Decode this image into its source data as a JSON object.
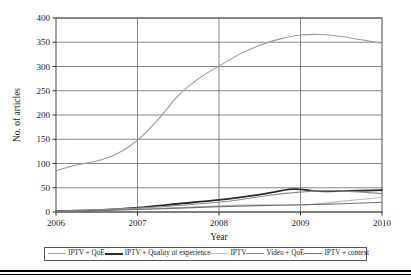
{
  "chart_data": {
    "type": "line",
    "title": "",
    "xlabel": "Year",
    "ylabel": "No. of articles",
    "xlim": [
      2006,
      2010
    ],
    "ylim": [
      0,
      400
    ],
    "ytick_step": 50,
    "grid": "horizontal-and-vertical",
    "legend_position": "bottom",
    "xticks": [
      "2006",
      "2007",
      "2008",
      "2009",
      "2010"
    ],
    "yticks": [
      "0",
      "50",
      "100",
      "150",
      "200",
      "250",
      "300",
      "350",
      "400"
    ],
    "x": [
      2006,
      2010
    ],
    "series": [
      {
        "name": "IPTV + QoE",
        "color": "#9a9a9a",
        "width": 1.1,
        "points": [
          [
            2006.0,
            85
          ],
          [
            2006.25,
            97
          ],
          [
            2006.5,
            105
          ],
          [
            2006.75,
            120
          ],
          [
            2007.0,
            148
          ],
          [
            2007.25,
            190
          ],
          [
            2007.5,
            240
          ],
          [
            2007.75,
            275
          ],
          [
            2008.0,
            301
          ],
          [
            2008.25,
            325
          ],
          [
            2008.5,
            344
          ],
          [
            2008.75,
            357
          ],
          [
            2009.0,
            365
          ],
          [
            2009.25,
            366
          ],
          [
            2009.5,
            362
          ],
          [
            2009.75,
            355
          ],
          [
            2010.0,
            348
          ]
        ]
      },
      {
        "name": "IPTV + Quality of experience",
        "color": "#2b2b2b",
        "width": 1.8,
        "points": [
          [
            2006.0,
            2
          ],
          [
            2006.5,
            4
          ],
          [
            2007.0,
            9
          ],
          [
            2007.5,
            17
          ],
          [
            2008.0,
            25
          ],
          [
            2008.5,
            36
          ],
          [
            2008.9,
            47
          ],
          [
            2009.2,
            43
          ],
          [
            2009.5,
            43
          ],
          [
            2010.0,
            45
          ]
        ]
      },
      {
        "name": "IPTV",
        "color": "#bdbdbd",
        "width": 1.1,
        "points": [
          [
            2006.0,
            1
          ],
          [
            2007.0,
            6
          ],
          [
            2008.0,
            13
          ],
          [
            2008.5,
            15
          ],
          [
            2009.0,
            14
          ],
          [
            2009.5,
            22
          ],
          [
            2010.0,
            30
          ]
        ]
      },
      {
        "name": "Video + QoE",
        "color": "#8c8c8c",
        "width": 1.1,
        "points": [
          [
            2006.0,
            2
          ],
          [
            2007.0,
            8
          ],
          [
            2008.0,
            20
          ],
          [
            2008.6,
            34
          ],
          [
            2009.0,
            41
          ],
          [
            2009.4,
            44
          ],
          [
            2010.0,
            38
          ]
        ]
      },
      {
        "name": "IPTV + context",
        "color": "#707070",
        "width": 1.1,
        "points": [
          [
            2006.0,
            1
          ],
          [
            2007.0,
            5
          ],
          [
            2008.0,
            11
          ],
          [
            2009.0,
            15
          ],
          [
            2009.5,
            17
          ],
          [
            2010.0,
            20
          ]
        ]
      }
    ]
  },
  "legend": {
    "items": [
      {
        "label": "IPTV + QoE",
        "color": "#9a9a9a",
        "width": "1px"
      },
      {
        "label": "IPTV + Quality of experience",
        "color": "#2b2b2b",
        "width": "2px"
      },
      {
        "label": "IPTV",
        "color": "#bdbdbd",
        "width": "1px"
      },
      {
        "label": "Video + QoE",
        "color": "#8c8c8c",
        "width": "1px"
      },
      {
        "label": "IPTV + context",
        "color": "#707070",
        "width": "1px"
      }
    ]
  },
  "axes": {
    "x_title": "Year",
    "y_title": "No. of articles"
  }
}
